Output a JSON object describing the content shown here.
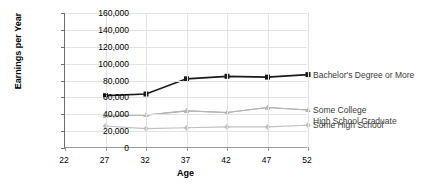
{
  "chart_data": {
    "type": "line",
    "title": "",
    "xlabel": "Age",
    "ylabel": "Earnings per Year",
    "x": [
      27,
      32,
      37,
      42,
      47,
      52
    ],
    "xlim": [
      22,
      52
    ],
    "ylim": [
      0,
      160000
    ],
    "xticks": [
      "22",
      "27",
      "32",
      "37",
      "42",
      "47",
      "52"
    ],
    "yticks": [
      "0",
      "20,000",
      "40,000",
      "60,000",
      "80,000",
      "100,000",
      "120,000",
      "140,000",
      "160,000"
    ],
    "grid": true,
    "legend_position": "right-inline",
    "series": [
      {
        "name": "Bachelor's Degree or More",
        "values": [
          62000,
          64000,
          82000,
          85000,
          84000,
          87000
        ],
        "color": "#1a1a1a",
        "marker": "square"
      },
      {
        "name": "Some College",
        "values": [
          38000,
          39000,
          44000,
          42000,
          48000,
          45000
        ],
        "color": "#a6a6a6",
        "marker": "triangle"
      },
      {
        "name": "High School Graduate",
        "values": [
          38000,
          39000,
          44000,
          42000,
          48000,
          45000
        ],
        "color": "#b5b5b5",
        "marker": "triangle"
      },
      {
        "name": "Some High School",
        "values": [
          26000,
          23000,
          24000,
          25000,
          25000,
          27000
        ],
        "color": "#c0c0c0",
        "marker": "diamond"
      }
    ]
  },
  "legend": {
    "entries": [
      {
        "label": "Bachelor's Degree or More"
      },
      {
        "label": "Some College"
      },
      {
        "label": "High School Graduate"
      },
      {
        "label": "Some High School"
      }
    ]
  }
}
